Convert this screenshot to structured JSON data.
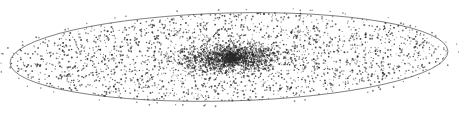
{
  "image": {
    "subject": "Stippled illustration of a disk galaxy seen nearly edge-on",
    "background": "#ffffff",
    "ink_color": "#2a2a2a"
  },
  "disk": {
    "cx": 229,
    "cy": 57,
    "rx": 219,
    "ry": 44,
    "rotation_deg": -1.5,
    "outline_color": "#444444",
    "dot_count": 2600
  },
  "bulge": {
    "cx": 230,
    "cy": 58,
    "rx": 58,
    "ry": 15,
    "dot_count": 2200,
    "nucleus": {
      "cx": 232,
      "cy": 58,
      "rx": 10,
      "ry": 6,
      "dot_count": 260
    }
  },
  "halo": {
    "dot_count": 60
  }
}
